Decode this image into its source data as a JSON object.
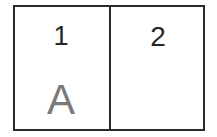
{
  "diagram": {
    "type": "two-cell-box",
    "background_color": "#ffffff",
    "border_color": "#2b2b2b",
    "border_width_px": 2,
    "cells": [
      {
        "id": "cell-1",
        "position": "left",
        "label": "1",
        "label_color": "#262626",
        "sublabel": "A",
        "sublabel_color": "#7a7a7a"
      },
      {
        "id": "cell-2",
        "position": "right",
        "label": "2",
        "label_color": "#262626",
        "sublabel": "",
        "sublabel_color": "#7a7a7a"
      }
    ]
  }
}
